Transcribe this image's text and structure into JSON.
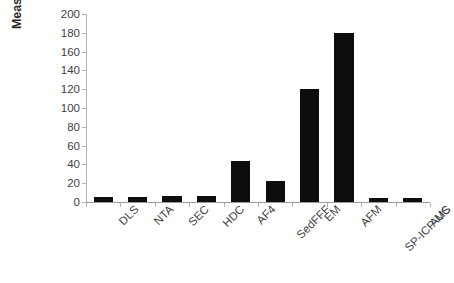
{
  "chart_data": {
    "type": "bar",
    "title": "",
    "subtitle": "",
    "xlabel": "",
    "ylabel": "Measurement duration in min",
    "ylabel_lines": [
      "Measurement duration",
      "in min"
    ],
    "categories": [
      "DLS",
      "NTA",
      "SEC",
      "HDC",
      "AF4",
      "SedFFF",
      "EM",
      "AFM",
      "SP-ICP-MS",
      "AUC"
    ],
    "values": [
      5,
      5,
      6,
      6,
      44,
      22,
      120,
      180,
      4,
      4
    ],
    "ylim": [
      0,
      200
    ],
    "ytick_labels": [
      "200",
      "180",
      "160",
      "140",
      "120",
      "100",
      "80",
      "60",
      "40",
      "20",
      "0"
    ],
    "ytick_values": [
      200,
      180,
      160,
      140,
      120,
      100,
      80,
      60,
      40,
      20,
      0
    ],
    "ytick_step": 20,
    "grid": false,
    "legend": false,
    "legend_position": "none",
    "bar_color": "#0d0d0d",
    "axis_color": "#b4b4b4",
    "background_color": "#ffffff",
    "text_color": "#3f3f3f",
    "xtick_label_rotation": -45
  }
}
